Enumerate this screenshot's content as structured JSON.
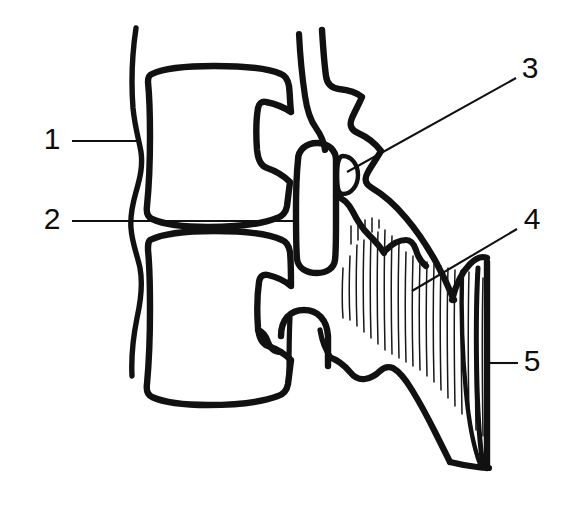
{
  "figure": {
    "view": "lateral (sagittal) section of two adjacent vertebrae",
    "background_color": "#ffffff",
    "ink_color": "#111111",
    "style": "black-and-white hand-drawn line art"
  },
  "labels": [
    {
      "id": "1",
      "text": "1",
      "x": 52,
      "y": 141,
      "leader": {
        "type": "horizontal",
        "x1": 72,
        "y1": 141,
        "x2": 141,
        "y2": 141
      },
      "points_to": "anterior-longitudinal-ligament"
    },
    {
      "id": "2",
      "text": "2",
      "x": 52,
      "y": 221,
      "leader": {
        "type": "horizontal",
        "x1": 72,
        "y1": 221,
        "x2": 296,
        "y2": 221
      },
      "points_to": "intervertebral-disc"
    },
    {
      "id": "3",
      "text": "3",
      "x": 530,
      "y": 70,
      "leader": {
        "type": "diagonal",
        "x1": 516,
        "y1": 78,
        "x2": 347,
        "y2": 172
      },
      "points_to": "facet-joint"
    },
    {
      "id": "4",
      "text": "4",
      "x": 532,
      "y": 221,
      "leader": {
        "type": "diagonal",
        "x1": 517,
        "y1": 229,
        "x2": 412,
        "y2": 291
      },
      "points_to": "interspinous-ligament"
    },
    {
      "id": "5",
      "text": "5",
      "x": 532,
      "y": 363,
      "leader": {
        "type": "horizontal",
        "x1": 518,
        "y1": 363,
        "x2": 489,
        "y2": 363
      },
      "points_to": "supraspinous-ligament"
    }
  ],
  "structures": {
    "anterior_ligament": {
      "name": "anterior longitudinal ligament",
      "stroke_width": 5
    },
    "upper_vertebral_body": {
      "name": "upper vertebral body",
      "stroke_width": 6
    },
    "lower_vertebral_body": {
      "name": "lower vertebral body",
      "stroke_width": 6
    },
    "upper_spinous_process": {
      "name": "upper spinous process",
      "stroke_width": 6
    },
    "lower_spinous_process": {
      "name": "lower spinous process",
      "stroke_width": 6
    },
    "facet_oval": {
      "name": "facet joint capsule",
      "stroke_width": 4
    },
    "interspinous_ligament": {
      "name": "interspinous ligament",
      "hatch_count": 26
    },
    "supraspinous_ligament": {
      "name": "supraspinous ligament",
      "stroke_width": 6
    }
  }
}
